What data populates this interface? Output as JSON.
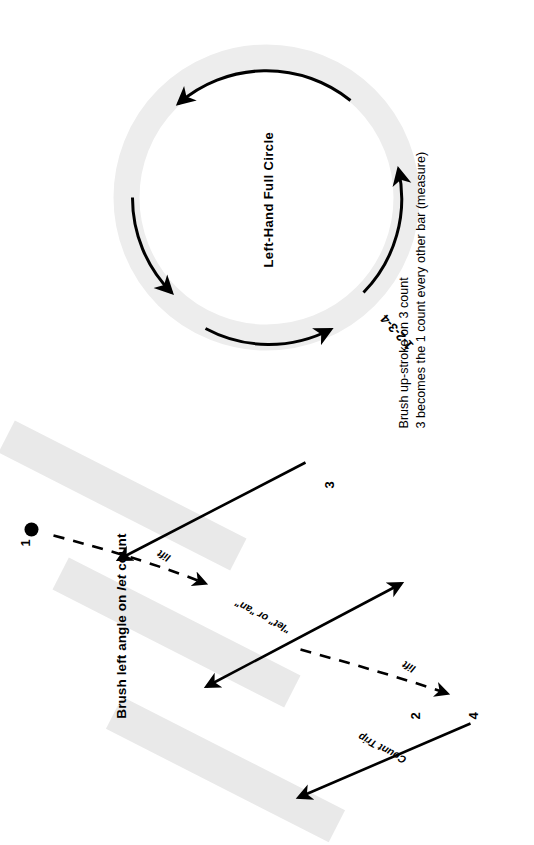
{
  "page": {
    "title_top": "Brush left angle on let count",
    "title_top_prefix": "Brush left angle on ",
    "title_top_emphasis": "let",
    "title_top_suffix": " count"
  },
  "notes": {
    "line1": "Brush up-stroke on 3 count",
    "line2": "3 becomes the 1 count every other bar (measure)"
  },
  "circle": {
    "label": "Left-Hand Full Circle",
    "count_label": "1-2-3-4"
  },
  "bars": [
    {
      "id": "bar-1",
      "count": "1"
    },
    {
      "id": "bar-2",
      "count": "2"
    },
    {
      "id": "bar-3",
      "count": "3"
    },
    {
      "id": "bar-4",
      "count": "4"
    }
  ],
  "stroke_labels": {
    "lift_upper": "lift",
    "lift_lower": "lift",
    "count_trip": "Count Trip",
    "let_or_an": "\"let\" or \"an\""
  },
  "colors": {
    "bar_fill": "#e8e8e8",
    "stroke": "#000000",
    "background": "#ffffff"
  }
}
